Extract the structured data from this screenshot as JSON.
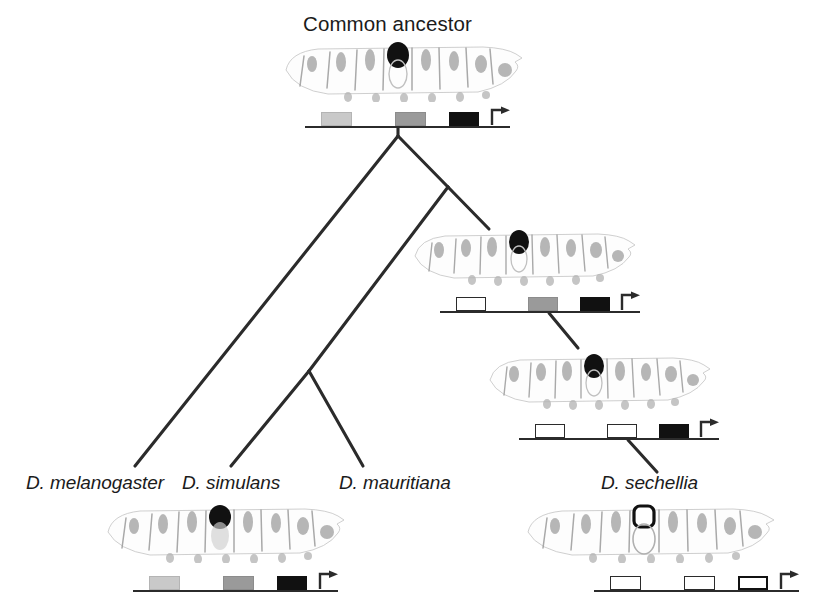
{
  "figure": {
    "type": "phylogenetic-tree",
    "root_label": "Common ancestor"
  },
  "labels": {
    "common_ancestor": "Common ancestor",
    "melanogaster": "D. melanogaster",
    "simulans": "D. simulans",
    "mauritiana": "D. mauritiana",
    "sechellia": "D. sechellia"
  },
  "colors": {
    "line": "#2b2b2b",
    "box_black": "#111111",
    "box_gray": "#9a9a9a",
    "box_light_gray": "#c9c9c9",
    "box_empty_fill": "#ffffff",
    "box_empty_stroke": "#2b2b2b",
    "larva_ink": "#8d8d8d",
    "spot_black": "#111111",
    "text": "#1b1b1b"
  },
  "tree": {
    "description": "Ladderized tree: D. melanogaster branches first from the root; the remaining clade splits into (D. simulans, D. mauritiana) and D. sechellia.",
    "nodes": [
      {
        "id": "root",
        "name": "Common ancestor",
        "x": 398,
        "y": 136
      },
      {
        "id": "node2",
        "name": "melanogaster-subgroup ancestor",
        "x": 448,
        "y": 187
      },
      {
        "id": "node3",
        "name": "simulans-mauritiana ancestor",
        "x": 309,
        "y": 371
      }
    ],
    "tips": [
      {
        "id": "mel",
        "name": "D. melanogaster",
        "x": 135,
        "y": 466
      },
      {
        "id": "sim",
        "name": "D. simulans",
        "x": 231,
        "y": 466
      },
      {
        "id": "mau",
        "name": "D. mauritiana",
        "x": 363,
        "y": 466
      },
      {
        "id": "sec",
        "name": "D. sechellia",
        "x": 655,
        "y": 466
      }
    ]
  },
  "panels": [
    {
      "id": "ancestor",
      "name": "common-ancestor-panel",
      "label": "Common ancestor",
      "spot": "pigmented",
      "spot_color": "#111111",
      "locus": {
        "name": "ancestor-locus",
        "boxes": [
          {
            "name": "enhancer-1",
            "state": "light-gray",
            "fill": "#c9c9c9",
            "left_pct": 8,
            "width_pct": 15
          },
          {
            "name": "enhancer-2",
            "state": "gray",
            "fill": "#9a9a9a",
            "left_pct": 44,
            "width_pct": 15
          },
          {
            "name": "enhancer-3",
            "state": "black",
            "fill": "#111111",
            "left_pct": 70,
            "width_pct": 15
          }
        ],
        "tss": {
          "name": "transcription-start-arrow",
          "left_pct": 91
        }
      }
    },
    {
      "id": "node2",
      "name": "subgroup-ancestor-panel",
      "label": "",
      "spot": "pigmented",
      "spot_color": "#111111",
      "locus": {
        "name": "node2-locus",
        "boxes": [
          {
            "name": "enhancer-1",
            "state": "empty",
            "fill": "#ffffff",
            "left_pct": 8,
            "width_pct": 15
          },
          {
            "name": "enhancer-2",
            "state": "gray",
            "fill": "#9a9a9a",
            "left_pct": 44,
            "width_pct": 15
          },
          {
            "name": "enhancer-3",
            "state": "black",
            "fill": "#111111",
            "left_pct": 70,
            "width_pct": 15
          }
        ],
        "tss": {
          "name": "transcription-start-arrow",
          "left_pct": 91
        }
      }
    },
    {
      "id": "node3",
      "name": "sechellia-lineage-ancestor-panel",
      "label": "",
      "spot": "pigmented",
      "spot_color": "#111111",
      "locus": {
        "name": "node3-locus",
        "boxes": [
          {
            "name": "enhancer-1",
            "state": "empty",
            "fill": "#ffffff",
            "left_pct": 8,
            "width_pct": 15
          },
          {
            "name": "enhancer-2",
            "state": "empty",
            "fill": "#ffffff",
            "left_pct": 44,
            "width_pct": 15
          },
          {
            "name": "enhancer-3",
            "state": "black",
            "fill": "#111111",
            "left_pct": 70,
            "width_pct": 15
          }
        ],
        "tss": {
          "name": "transcription-start-arrow",
          "left_pct": 91
        }
      }
    },
    {
      "id": "melanogaster",
      "name": "melanogaster-panel",
      "label": "D. melanogaster",
      "spot": "pigmented",
      "spot_color": "#111111",
      "locus": {
        "name": "melanogaster-locus",
        "boxes": [
          {
            "name": "enhancer-1",
            "state": "light-gray",
            "fill": "#c9c9c9",
            "left_pct": 8,
            "width_pct": 15
          },
          {
            "name": "enhancer-2",
            "state": "gray",
            "fill": "#9a9a9a",
            "left_pct": 44,
            "width_pct": 15
          },
          {
            "name": "enhancer-3",
            "state": "black",
            "fill": "#111111",
            "left_pct": 70,
            "width_pct": 15
          }
        ],
        "tss": {
          "name": "transcription-start-arrow",
          "left_pct": 91
        }
      }
    },
    {
      "id": "sechellia",
      "name": "sechellia-panel",
      "label": "D. sechellia",
      "spot": "unpigmented",
      "spot_color": "#ffffff",
      "locus": {
        "name": "sechellia-locus",
        "boxes": [
          {
            "name": "enhancer-1",
            "state": "empty",
            "fill": "#ffffff",
            "left_pct": 8,
            "width_pct": 15
          },
          {
            "name": "enhancer-2",
            "state": "empty",
            "fill": "#ffffff",
            "left_pct": 44,
            "width_pct": 15
          },
          {
            "name": "enhancer-3",
            "state": "empty-bold",
            "fill": "#ffffff",
            "left_pct": 70,
            "width_pct": 15
          }
        ],
        "tss": {
          "name": "transcription-start-arrow",
          "left_pct": 91
        }
      }
    }
  ]
}
